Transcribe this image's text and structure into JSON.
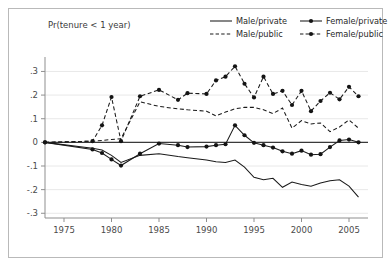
{
  "figure": {
    "axis_title": "Pr(tenure < 1 year)",
    "background_color": "#ffffff",
    "frame_color": "#b9b9b9",
    "line_color": "#1a1a1a"
  },
  "legend": {
    "entries": [
      {
        "label": "Male/private",
        "style": "solid",
        "marker": false
      },
      {
        "label": "Female/private",
        "style": "solid",
        "marker": true
      },
      {
        "label": "Male/public",
        "style": "dashed",
        "marker": false
      },
      {
        "label": "Female/public",
        "style": "dashed",
        "marker": true
      }
    ]
  },
  "axes": {
    "y_ticks": [
      ".3",
      ".2",
      ".1",
      "0",
      "-.1",
      "-.2",
      "-.3"
    ],
    "y_values": [
      0.3,
      0.2,
      0.1,
      0,
      -0.1,
      -0.2,
      -0.3
    ],
    "x_ticks": [
      "1975",
      "1980",
      "1985",
      "1990",
      "1995",
      "2000",
      "2005"
    ],
    "x_values": [
      1975,
      1980,
      1985,
      1990,
      1995,
      2000,
      2005
    ]
  },
  "chart_data": {
    "type": "line",
    "title": "",
    "xlabel": "",
    "ylabel": "Pr(tenure < 1 year)",
    "xlim": [
      1973,
      2007
    ],
    "ylim": [
      -0.32,
      0.34
    ],
    "grid": true,
    "legend_position": "top-right",
    "x": [
      1973,
      1978,
      1979,
      1980,
      1981,
      1983,
      1985,
      1987,
      1988,
      1990,
      1991,
      1992,
      1993,
      1994,
      1995,
      1996,
      1997,
      1998,
      1999,
      2000,
      2001,
      2002,
      2003,
      2004,
      2005,
      2006
    ],
    "series": [
      {
        "name": "Male/private",
        "style": "solid",
        "marker": false,
        "values": [
          0.0,
          -0.025,
          -0.032,
          -0.055,
          -0.085,
          -0.055,
          -0.048,
          -0.06,
          -0.065,
          -0.075,
          -0.082,
          -0.085,
          -0.075,
          -0.105,
          -0.148,
          -0.158,
          -0.152,
          -0.19,
          -0.168,
          -0.178,
          -0.186,
          -0.172,
          -0.162,
          -0.158,
          -0.185,
          -0.232
        ]
      },
      {
        "name": "Female/private",
        "style": "solid",
        "marker": true,
        "values": [
          0.0,
          -0.03,
          -0.045,
          -0.072,
          -0.098,
          -0.048,
          -0.005,
          -0.012,
          -0.02,
          -0.018,
          -0.012,
          -0.008,
          0.072,
          0.03,
          -0.002,
          -0.012,
          -0.022,
          -0.038,
          -0.048,
          -0.035,
          -0.052,
          -0.05,
          -0.02,
          0.008,
          0.012,
          0.0
        ]
      },
      {
        "name": "Male/public",
        "style": "dashed",
        "marker": false,
        "values": [
          0.0,
          0.005,
          0.008,
          0.012,
          0.015,
          0.172,
          0.152,
          0.142,
          0.138,
          0.132,
          0.112,
          0.128,
          0.142,
          0.148,
          0.148,
          0.138,
          0.122,
          0.145,
          0.06,
          0.092,
          0.078,
          0.082,
          0.045,
          0.065,
          0.095,
          0.06
        ]
      },
      {
        "name": "Female/public",
        "style": "dashed",
        "marker": true,
        "values": [
          0.0,
          0.005,
          0.072,
          0.192,
          0.005,
          0.195,
          0.222,
          0.18,
          0.208,
          0.205,
          0.262,
          0.278,
          0.322,
          0.248,
          0.19,
          0.278,
          0.205,
          0.218,
          0.158,
          0.218,
          0.132,
          0.175,
          0.21,
          0.182,
          0.235,
          0.195
        ]
      }
    ]
  }
}
